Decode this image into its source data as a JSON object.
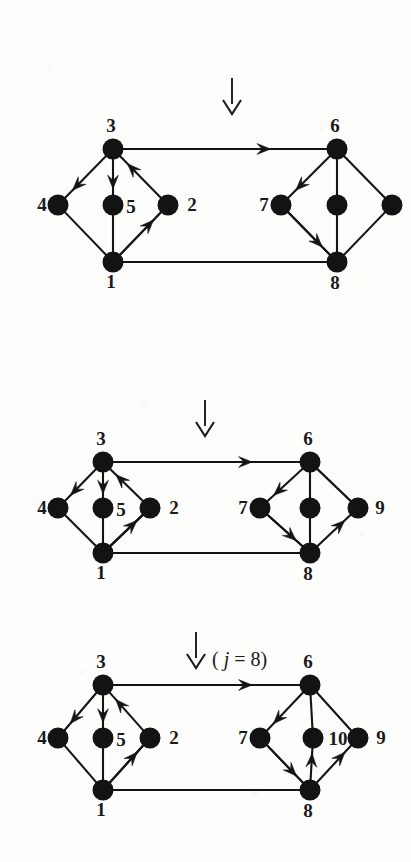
{
  "figure": {
    "background_color": "#fdfdfb",
    "ink_color": "#141414",
    "node_radius": 10.5,
    "step_labels": [
      {
        "id": "step-arrow-1",
        "text": "",
        "glyph": "down-arrow",
        "x": 232,
        "y": 78
      },
      {
        "id": "step-arrow-2",
        "text": "",
        "glyph": "down-arrow",
        "x": 205,
        "y": 400
      },
      {
        "id": "step-arrow-3",
        "text": "( j = 8)",
        "glyph": "down-arrow",
        "x": 196,
        "y": 632
      }
    ],
    "panels": [
      {
        "id": "panel-1",
        "name": "graph-stage-1",
        "origin_y": 110,
        "nodes": [
          {
            "id": "n3",
            "label": "3",
            "x": 113,
            "y": 39,
            "label_dx": -2,
            "label_dy": -17,
            "anchor": "middle"
          },
          {
            "id": "n4",
            "label": "4",
            "x": 58,
            "y": 95,
            "label_dx": -16,
            "label_dy": 6,
            "anchor": "middle"
          },
          {
            "id": "n5",
            "label": "5",
            "x": 113,
            "y": 95,
            "label_dx": 18,
            "label_dy": 8,
            "anchor": "middle"
          },
          {
            "id": "n2",
            "label": "2",
            "x": 168,
            "y": 95,
            "label_dx": 24,
            "label_dy": 6,
            "anchor": "middle"
          },
          {
            "id": "n1",
            "label": "1",
            "x": 113,
            "y": 152,
            "label_dx": -2,
            "label_dy": 26,
            "anchor": "middle"
          },
          {
            "id": "n6",
            "label": "6",
            "x": 337,
            "y": 39,
            "label_dx": -2,
            "label_dy": -17,
            "anchor": "middle"
          },
          {
            "id": "n7",
            "label": "7",
            "x": 281,
            "y": 95,
            "label_dx": -17,
            "label_dy": 6,
            "anchor": "middle"
          },
          {
            "id": "nc",
            "label": "",
            "x": 337,
            "y": 95,
            "label_dx": 0,
            "label_dy": 0,
            "anchor": "middle"
          },
          {
            "id": "nr",
            "label": "",
            "x": 392,
            "y": 95,
            "label_dx": 0,
            "label_dy": 0,
            "anchor": "middle"
          },
          {
            "id": "n8",
            "label": "8",
            "x": 337,
            "y": 152,
            "label_dx": -2,
            "label_dy": 27,
            "anchor": "middle"
          }
        ],
        "plain_edges": [
          [
            "n4",
            "n1"
          ],
          [
            "n2",
            "n1"
          ],
          [
            "n5",
            "n1"
          ],
          [
            "n1",
            "n8"
          ],
          [
            "n6",
            "nc"
          ],
          [
            "n6",
            "nr"
          ],
          [
            "nr",
            "n8"
          ],
          [
            "nc",
            "n8"
          ],
          [
            "n7",
            "n8"
          ]
        ],
        "directed_edges": [
          {
            "from": "n3",
            "to": "n4",
            "name": "edge-3-to-4"
          },
          {
            "from": "n3",
            "to": "n5",
            "name": "edge-3-to-5"
          },
          {
            "from": "n2",
            "to": "n3",
            "name": "edge-2-to-3"
          },
          {
            "from": "n1",
            "to": "n2",
            "name": "edge-1-to-2"
          },
          {
            "from": "n3",
            "to": "n6",
            "name": "edge-3-to-6",
            "barb_t": 0.72
          },
          {
            "from": "n6",
            "to": "n7",
            "name": "edge-6-to-7"
          },
          {
            "from": "n7",
            "to": "n8",
            "name": "edge-7-to-8"
          }
        ]
      },
      {
        "id": "panel-2",
        "name": "graph-stage-2",
        "origin_y": 423,
        "nodes": [
          {
            "id": "n3",
            "label": "3",
            "x": 103,
            "y": 39,
            "label_dx": -2,
            "label_dy": -17,
            "anchor": "middle"
          },
          {
            "id": "n4",
            "label": "4",
            "x": 58,
            "y": 85,
            "label_dx": -16,
            "label_dy": 6,
            "anchor": "middle"
          },
          {
            "id": "n5",
            "label": "5",
            "x": 103,
            "y": 85,
            "label_dx": 18,
            "label_dy": 8,
            "anchor": "middle"
          },
          {
            "id": "n2",
            "label": "2",
            "x": 150,
            "y": 85,
            "label_dx": 24,
            "label_dy": 6,
            "anchor": "middle"
          },
          {
            "id": "n1",
            "label": "1",
            "x": 103,
            "y": 130,
            "label_dx": -2,
            "label_dy": 26,
            "anchor": "middle"
          },
          {
            "id": "n6",
            "label": "6",
            "x": 310,
            "y": 39,
            "label_dx": -2,
            "label_dy": -17,
            "anchor": "middle"
          },
          {
            "id": "n7",
            "label": "7",
            "x": 260,
            "y": 85,
            "label_dx": -17,
            "label_dy": 6,
            "anchor": "middle"
          },
          {
            "id": "nc",
            "label": "",
            "x": 310,
            "y": 85,
            "label_dx": 0,
            "label_dy": 0,
            "anchor": "middle"
          },
          {
            "id": "n9",
            "label": "9",
            "x": 358,
            "y": 85,
            "label_dx": 22,
            "label_dy": 6,
            "anchor": "middle"
          },
          {
            "id": "n8",
            "label": "8",
            "x": 310,
            "y": 130,
            "label_dx": -2,
            "label_dy": 27,
            "anchor": "middle"
          }
        ],
        "plain_edges": [
          [
            "n4",
            "n1"
          ],
          [
            "n2",
            "n1"
          ],
          [
            "n5",
            "n1"
          ],
          [
            "n1",
            "n8"
          ],
          [
            "n6",
            "nc"
          ],
          [
            "n6",
            "n9"
          ],
          [
            "nc",
            "n8"
          ],
          [
            "n7",
            "n8"
          ]
        ],
        "directed_edges": [
          {
            "from": "n3",
            "to": "n4",
            "name": "edge-3-to-4"
          },
          {
            "from": "n3",
            "to": "n5",
            "name": "edge-3-to-5"
          },
          {
            "from": "n2",
            "to": "n3",
            "name": "edge-2-to-3"
          },
          {
            "from": "n1",
            "to": "n2",
            "name": "edge-1-to-2"
          },
          {
            "from": "n3",
            "to": "n6",
            "name": "edge-3-to-6",
            "barb_t": 0.74
          },
          {
            "from": "n6",
            "to": "n7",
            "name": "edge-6-to-7"
          },
          {
            "from": "n7",
            "to": "n8",
            "name": "edge-7-to-8"
          },
          {
            "from": "n8",
            "to": "n9",
            "name": "edge-8-to-9"
          }
        ]
      },
      {
        "id": "panel-3",
        "name": "graph-stage-3",
        "origin_y": 646,
        "nodes": [
          {
            "id": "n3",
            "label": "3",
            "x": 103,
            "y": 39,
            "label_dx": -2,
            "label_dy": -17,
            "anchor": "middle"
          },
          {
            "id": "n4",
            "label": "4",
            "x": 58,
            "y": 92,
            "label_dx": -16,
            "label_dy": 6,
            "anchor": "middle"
          },
          {
            "id": "n5",
            "label": "5",
            "x": 103,
            "y": 92,
            "label_dx": 18,
            "label_dy": 8,
            "anchor": "middle"
          },
          {
            "id": "n2",
            "label": "2",
            "x": 150,
            "y": 92,
            "label_dx": 24,
            "label_dy": 6,
            "anchor": "middle"
          },
          {
            "id": "n1",
            "label": "1",
            "x": 103,
            "y": 144,
            "label_dx": -2,
            "label_dy": 26,
            "anchor": "middle"
          },
          {
            "id": "n6",
            "label": "6",
            "x": 310,
            "y": 39,
            "label_dx": -2,
            "label_dy": -17,
            "anchor": "middle"
          },
          {
            "id": "n7",
            "label": "7",
            "x": 260,
            "y": 92,
            "label_dx": -17,
            "label_dy": 6,
            "anchor": "middle"
          },
          {
            "id": "n10",
            "label": "10",
            "x": 313,
            "y": 92,
            "label_dx": 25,
            "label_dy": 7,
            "anchor": "middle"
          },
          {
            "id": "n9",
            "label": "9",
            "x": 358,
            "y": 92,
            "label_dx": 23,
            "label_dy": 6,
            "anchor": "middle"
          },
          {
            "id": "n8",
            "label": "8",
            "x": 310,
            "y": 144,
            "label_dx": -2,
            "label_dy": 27,
            "anchor": "middle"
          }
        ],
        "plain_edges": [
          [
            "n4",
            "n1"
          ],
          [
            "n2",
            "n1"
          ],
          [
            "n5",
            "n1"
          ],
          [
            "n1",
            "n8"
          ],
          [
            "n6",
            "n10"
          ],
          [
            "n6",
            "n9"
          ],
          [
            "n7",
            "n8"
          ]
        ],
        "directed_edges": [
          {
            "from": "n3",
            "to": "n4",
            "name": "edge-3-to-4"
          },
          {
            "from": "n3",
            "to": "n5",
            "name": "edge-3-to-5"
          },
          {
            "from": "n2",
            "to": "n3",
            "name": "edge-2-to-3"
          },
          {
            "from": "n1",
            "to": "n2",
            "name": "edge-1-to-2"
          },
          {
            "from": "n3",
            "to": "n6",
            "name": "edge-3-to-6",
            "barb_t": 0.74
          },
          {
            "from": "n6",
            "to": "n7",
            "name": "edge-6-to-7"
          },
          {
            "from": "n7",
            "to": "n8",
            "name": "edge-7-to-8"
          },
          {
            "from": "n8",
            "to": "n9",
            "name": "edge-8-to-9"
          },
          {
            "from": "n8",
            "to": "n10",
            "name": "edge-8-to-10"
          }
        ]
      }
    ]
  }
}
